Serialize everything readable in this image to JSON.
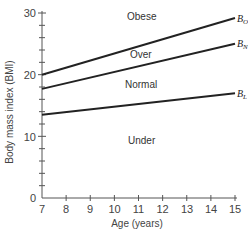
{
  "chart_data": {
    "type": "line",
    "title": "",
    "xlabel": "Age (years)",
    "ylabel": "Body mass index (BMI)",
    "xlim": [
      7,
      15
    ],
    "ylim": [
      0,
      30
    ],
    "x_ticks": [
      7,
      8,
      9,
      10,
      11,
      12,
      13,
      14,
      15
    ],
    "y_tick_labels": [
      0,
      10,
      20,
      30
    ],
    "y_minor_step": 2,
    "grid": false,
    "legend": "none",
    "series": [
      {
        "name": "B_O",
        "label_main": "B",
        "label_sub": "O",
        "x": [
          7,
          15
        ],
        "values": [
          20,
          29.2
        ]
      },
      {
        "name": "B_N",
        "label_main": "B",
        "label_sub": "N",
        "x": [
          7,
          15
        ],
        "values": [
          17.7,
          25
        ]
      },
      {
        "name": "B_L",
        "label_main": "B",
        "label_sub": "L",
        "x": [
          7,
          15
        ],
        "values": [
          13.5,
          17
        ]
      }
    ],
    "annotations": [
      {
        "text": "Obese",
        "x": 11.3,
        "y": 29
      },
      {
        "text": "Over",
        "x": 11.4,
        "y": 23
      },
      {
        "text": "Normal",
        "x": 11.1,
        "y": 18
      },
      {
        "text": "Under",
        "x": 11.3,
        "y": 9
      }
    ]
  },
  "labels": {
    "xlabel": "Age (years)",
    "ylabel": "Body mass index (BMI)",
    "regions": {
      "obese": "Obese",
      "over": "Over",
      "normal": "Normal",
      "under": "Under"
    },
    "lines": {
      "obese": {
        "main": "B",
        "sub": "O"
      },
      "over": {
        "main": "B",
        "sub": "N"
      },
      "normal": {
        "main": "B",
        "sub": "L"
      }
    },
    "x_ticks": [
      "7",
      "8",
      "9",
      "10",
      "11",
      "12",
      "13",
      "14",
      "15"
    ],
    "y_ticks": [
      "0",
      "10",
      "20",
      "30"
    ]
  },
  "colors": {
    "axis": "#555555",
    "line": "#222222",
    "text": "#444444"
  }
}
